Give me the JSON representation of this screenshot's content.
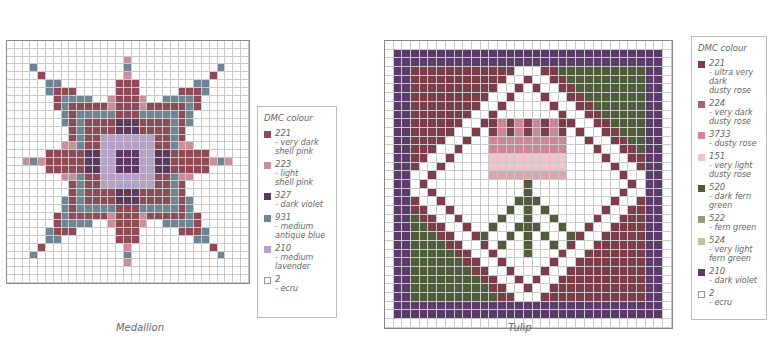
{
  "palette": {
    "221": "#8e4b57",
    "223": "#c98f98",
    "327": "#5b3a5e",
    "931": "#6f8595",
    "210": "#b6a1c6",
    "2": "#ffffff",
    "224": "#d9a7ae",
    "3733": "#cf8796",
    "151": "#efc4cc",
    "520": "#4f5d3a",
    "522": "#8f9c78",
    "524": "#b9c4aa",
    "t221": "#7d3e4c",
    "t210": "#5a3b6a"
  },
  "charts": [
    {
      "id": "medallion",
      "caption": "Medallion",
      "legend": {
        "title": "DMC colour",
        "items": [
          {
            "code": "221",
            "name": "- very dark\nshell pink",
            "color": "#8e4b57"
          },
          {
            "code": "223",
            "name": "- light\nshell pink",
            "color": "#c98f98"
          },
          {
            "code": "327",
            "name": "- dark violet",
            "color": "#5b3a5e"
          },
          {
            "code": "931",
            "name": "- medium\nantique blue",
            "color": "#6f8595"
          },
          {
            "code": "210",
            "name": "- medium\nlavender",
            "color": "#b6a1c6"
          },
          {
            "code": "2",
            "name": "- ecru",
            "color": "#ffffff"
          }
        ]
      }
    },
    {
      "id": "tulip",
      "caption": "Tulip",
      "legend": {
        "title": "DMC colour",
        "items": [
          {
            "code": "221",
            "name": "- ultra very dark\ndusty rose",
            "color": "#7d3e4c"
          },
          {
            "code": "224",
            "name": "- very dark\ndusty rose",
            "color": "#a8646f"
          },
          {
            "code": "3733",
            "name": "- dusty rose",
            "color": "#cf8796"
          },
          {
            "code": "151",
            "name": "- very light\ndusty rose",
            "color": "#efc4cc"
          },
          {
            "code": "520",
            "name": "- dark fern green",
            "color": "#4f5d3a"
          },
          {
            "code": "522",
            "name": "- fern green",
            "color": "#8f9c78"
          },
          {
            "code": "524",
            "name": "- very light\nfern green",
            "color": "#b9c4aa"
          },
          {
            "code": "210",
            "name": "- dark violet",
            "color": "#5a3b6a"
          },
          {
            "code": "2",
            "name": "- ecru",
            "color": "#ffffff"
          }
        ]
      }
    }
  ]
}
